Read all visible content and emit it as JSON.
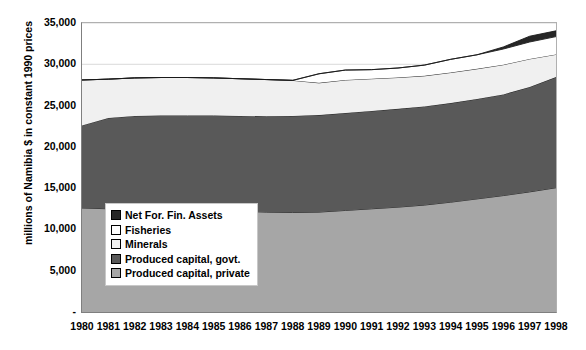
{
  "chart_data": {
    "type": "area",
    "title": "",
    "stacked": true,
    "xlabel": "",
    "ylabel": "millions of Namibia $ in constant 1990 prices",
    "ylim": [
      0,
      35000
    ],
    "ytick_labels": [
      "35,000",
      "30,000",
      "25,000",
      "20,000",
      "15,000",
      "10,000",
      "5,000",
      "-"
    ],
    "ytick_values": [
      35000,
      30000,
      25000,
      20000,
      15000,
      10000,
      5000,
      0
    ],
    "grid": true,
    "legend_position": "inside-left",
    "categories": [
      1980,
      1981,
      1982,
      1983,
      1984,
      1985,
      1986,
      1987,
      1988,
      1989,
      1990,
      1991,
      1992,
      1993,
      1994,
      1995,
      1996,
      1997,
      1998
    ],
    "tick_labels": [
      "1980",
      "1981",
      "1982",
      "1983",
      "1984",
      "1985",
      "1986",
      "1987",
      "1988",
      "1989",
      "1990",
      "1991",
      "1992",
      "1993",
      "1994",
      "1995",
      "1996",
      "1997",
      "1998"
    ],
    "stack_order_bottom_to_top": [
      "Produced capital, private",
      "Produced capital, govt.",
      "Minerals",
      "Fisheries",
      "Net For. Fin. Assets"
    ],
    "series": [
      {
        "name": "Produced capital, private",
        "color": "#a6a6a6",
        "values": [
          12600,
          12500,
          12450,
          12400,
          12350,
          12300,
          12200,
          12100,
          12050,
          12100,
          12300,
          12500,
          12700,
          12950,
          13300,
          13700,
          14100,
          14550,
          15050
        ]
      },
      {
        "name": "Produced capital, govt.",
        "color": "#595959",
        "values": [
          10000,
          11000,
          11300,
          11400,
          11450,
          11500,
          11550,
          11600,
          11700,
          11750,
          11800,
          11850,
          11900,
          11950,
          12000,
          12100,
          12250,
          12700,
          13400
        ]
      },
      {
        "name": "Minerals",
        "color": "#f0f0f0",
        "values": [
          5500,
          4700,
          4600,
          4600,
          4600,
          4550,
          4500,
          4450,
          4300,
          3900,
          4000,
          3900,
          3800,
          3700,
          3700,
          3650,
          3600,
          3400,
          2750
        ]
      },
      {
        "name": "Fisheries",
        "color": "#ffffff",
        "values": [
          0,
          0,
          0,
          0,
          0,
          0,
          0,
          0,
          0,
          1100,
          1200,
          1100,
          1150,
          1300,
          1600,
          1700,
          1900,
          2050,
          2150
        ]
      },
      {
        "name": "Net For. Fin. Assets",
        "color": "#262626",
        "values": [
          0,
          0,
          0,
          0,
          0,
          0,
          0,
          0,
          0,
          0,
          0,
          0,
          0,
          0,
          0,
          0,
          250,
          700,
          700
        ]
      }
    ],
    "totals": [
      28100,
      28200,
      28350,
      28400,
      28400,
      28350,
      28250,
      28150,
      28050,
      28850,
      29300,
      29350,
      29550,
      29900,
      30600,
      31150,
      32100,
      33400,
      34050
    ]
  },
  "legend": {
    "items": [
      {
        "label": "Net For. Fin. Assets",
        "color": "#262626"
      },
      {
        "label": "Fisheries",
        "color": "#ffffff"
      },
      {
        "label": "Minerals",
        "color": "#f0f0f0"
      },
      {
        "label": "Produced capital, govt.",
        "color": "#595959"
      },
      {
        "label": "Produced capital, private",
        "color": "#a6a6a6"
      }
    ]
  }
}
